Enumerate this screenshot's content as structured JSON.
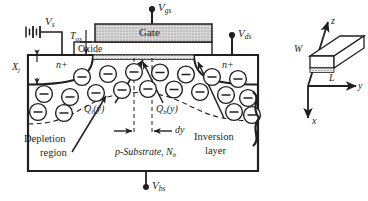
{
  "figure": {
    "type": "diagram",
    "background_color": "#ffffff",
    "ink_color": "#231f20",
    "gate_fill": "#d7d7d7",
    "oxide_fill": "#ffffff"
  },
  "terminals": {
    "source_voltage": {
      "symbol": "V",
      "subscript": "s"
    },
    "gate_voltage": {
      "symbol": "V",
      "subscript": "gs"
    },
    "drain_voltage": {
      "symbol": "V",
      "subscript": "ds"
    },
    "bulk_voltage": {
      "symbol": "V",
      "subscript": "bs"
    }
  },
  "layers": {
    "gate_label": "Gate",
    "oxide_label": "Oxide",
    "oxide_thickness": {
      "symbol": "T",
      "subscript": "ox"
    },
    "junction_depth": {
      "symbol": "X",
      "subscript": "j"
    },
    "source_region": "n+",
    "drain_region": "n+",
    "substrate": {
      "text": "p-Substrate, ",
      "symbol": "N",
      "subscript": "b"
    }
  },
  "annotations": {
    "depletion_region_line1": "Depletion",
    "depletion_region_line2": "region",
    "inversion_layer_line1": "Inversion",
    "inversion_layer_line2": "layer",
    "inversion_charge": {
      "symbol": "Q",
      "subscript": "i",
      "arg": "(y)"
    },
    "bulk_charge": {
      "symbol": "Q",
      "subscript": "b",
      "arg": "(y)"
    },
    "differential_length": "dy"
  },
  "axes_3d": {
    "axis_z": "z",
    "axis_y": "y",
    "axis_x": "x",
    "width_label": "W",
    "length_label": "L"
  },
  "charges": {
    "inversion_symbol": "−",
    "depletion_symbol": "−",
    "inversion_row_count": 7,
    "lower_row_counts": [
      6,
      8
    ]
  }
}
